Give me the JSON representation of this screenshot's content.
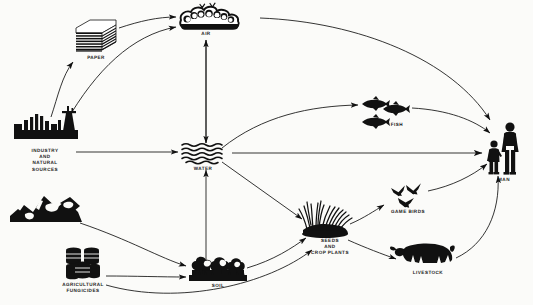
{
  "diagram": {
    "background_color": "#fbfbf9",
    "ink_color": "#111111",
    "nodes": [
      {
        "id": "industry",
        "label": "INDUSTRY\nAND\nNATURAL\nSOURCES",
        "icon": "factory-icon",
        "x": 45,
        "y": 128
      },
      {
        "id": "paper",
        "label": "PAPER",
        "icon": "paper-stack-icon",
        "x": 96,
        "y": 37
      },
      {
        "id": "air",
        "label": "AIR",
        "icon": "cloud-icon",
        "x": 206,
        "y": 26
      },
      {
        "id": "water",
        "label": "WATER",
        "icon": "water-waves-icon",
        "x": 203,
        "y": 152
      },
      {
        "id": "mountains",
        "label": "",
        "icon": "mountains-icon",
        "x": 45,
        "y": 207
      },
      {
        "id": "fungicides",
        "label": "AGRICULTURAL\nFUNGICIDES",
        "icon": "barrels-icon",
        "x": 83,
        "y": 265
      },
      {
        "id": "soil",
        "label": "SOIL",
        "icon": "soil-trees-icon",
        "x": 218,
        "y": 273
      },
      {
        "id": "seeds",
        "label": "SEEDS\nAND\nCROP PLANTS",
        "icon": "crop-plants-icon",
        "x": 330,
        "y": 232
      },
      {
        "id": "gamebirds",
        "label": "GAME BIRDS",
        "icon": "birds-icon",
        "x": 408,
        "y": 200
      },
      {
        "id": "livestock",
        "label": "LIVESTOCK",
        "icon": "cow-icon",
        "x": 428,
        "y": 262
      },
      {
        "id": "fish",
        "label": "FISH",
        "icon": "fish-icon",
        "x": 397,
        "y": 113
      },
      {
        "id": "man",
        "label": "MAN",
        "icon": "man-child-icon",
        "x": 503,
        "y": 150
      }
    ],
    "labels": {
      "industry": "INDUSTRY\nAND\nNATURAL\nSOURCES",
      "paper": "PAPER",
      "air": "AIR",
      "water": "WATER",
      "fungicides": "AGRICULTURAL\nFUNGICIDES",
      "soil": "SOIL",
      "seeds": "SEEDS\nAND\nCROP PLANTS",
      "gamebirds": "GAME BIRDS",
      "livestock": "LIVESTOCK",
      "fish": "FISH",
      "man": "MAN"
    },
    "flows": [
      {
        "from": "industry",
        "to": "paper"
      },
      {
        "from": "paper",
        "to": "air"
      },
      {
        "from": "industry",
        "to": "air"
      },
      {
        "from": "industry",
        "to": "water"
      },
      {
        "from": "air",
        "to": "water"
      },
      {
        "from": "water",
        "to": "air"
      },
      {
        "from": "air",
        "to": "man"
      },
      {
        "from": "water",
        "to": "fish"
      },
      {
        "from": "water",
        "to": "man"
      },
      {
        "from": "water",
        "to": "seeds"
      },
      {
        "from": "soil",
        "to": "water"
      },
      {
        "from": "mountains",
        "to": "soil"
      },
      {
        "from": "fungicides",
        "to": "soil"
      },
      {
        "from": "fungicides",
        "to": "seeds"
      },
      {
        "from": "soil",
        "to": "seeds"
      },
      {
        "from": "seeds",
        "to": "gamebirds"
      },
      {
        "from": "seeds",
        "to": "livestock"
      },
      {
        "from": "fish",
        "to": "man"
      },
      {
        "from": "gamebirds",
        "to": "man"
      },
      {
        "from": "livestock",
        "to": "man"
      }
    ]
  }
}
